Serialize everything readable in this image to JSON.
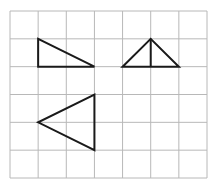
{
  "figure": {
    "grid": {
      "columns": 7,
      "rows": 6
    },
    "colors": {
      "grid_line": "#b8b8b8",
      "shape_stroke": "#1a1a1a",
      "background": "#ffffff"
    },
    "shapes": [
      {
        "name": "right-triangle",
        "points": [
          [
            1,
            1
          ],
          [
            1,
            2
          ],
          [
            3,
            2
          ]
        ],
        "segments": []
      },
      {
        "name": "isosceles-triangle-with-altitude",
        "points": [
          [
            4,
            2
          ],
          [
            5,
            1
          ],
          [
            6,
            2
          ]
        ],
        "segments": [
          [
            [
              5,
              1
            ],
            [
              5,
              2
            ]
          ]
        ]
      },
      {
        "name": "left-pointing-triangle",
        "points": [
          [
            3,
            3
          ],
          [
            3,
            5
          ],
          [
            1,
            4
          ]
        ],
        "segments": []
      }
    ]
  }
}
